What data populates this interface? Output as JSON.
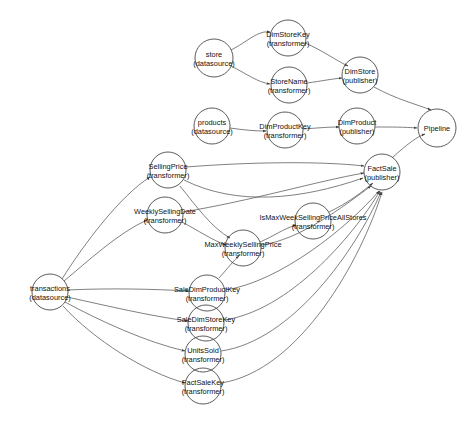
{
  "diagram": {
    "background_color": "#ffffff",
    "node_stroke_color": "#4a4a4a",
    "edge_color": "#555555",
    "text_color": "#111111",
    "node_radius": 18,
    "nodes": [
      {
        "id": "store",
        "name": "store",
        "kind": "(datasource)",
        "cx": 214,
        "cy": 58,
        "r": 19
      },
      {
        "id": "DimStoreKey",
        "name": "DimStoreKey",
        "kind": "(transformer)",
        "cx": 288,
        "cy": 38,
        "r": 18
      },
      {
        "id": "StoreName",
        "name": "StoreName",
        "kind": "(transformer)",
        "cx": 289,
        "cy": 85,
        "r": 18
      },
      {
        "id": "DimStore",
        "name": "DimStore",
        "kind": "(publisher)",
        "cx": 360,
        "cy": 75,
        "r": 18
      },
      {
        "id": "products",
        "name": "products",
        "kind": "(datasource)",
        "cx": 212,
        "cy": 126,
        "r": 18
      },
      {
        "id": "DimProductKey",
        "name": "DimProductKey",
        "kind": "(transformer)",
        "cx": 285,
        "cy": 130,
        "r": 18
      },
      {
        "id": "DimProduct",
        "name": "DimProduct",
        "kind": "(publisher)",
        "cx": 357,
        "cy": 126,
        "r": 18
      },
      {
        "id": "Pipeline",
        "name": "Pipeline",
        "kind": "",
        "cx": 437,
        "cy": 128,
        "r": 19
      },
      {
        "id": "SellingPrice",
        "name": "SellingPrice",
        "kind": "(transformer)",
        "cx": 168,
        "cy": 170,
        "r": 18
      },
      {
        "id": "WeeklySellingDate",
        "name": "WeeklySellingDate",
        "kind": "(transformer)",
        "cx": 165,
        "cy": 215,
        "r": 18
      },
      {
        "id": "IsMaxWeekSellingPriceAllStores",
        "name": "IsMaxWeekSellingPriceAllStores",
        "kind": "(transformer)",
        "cx": 313,
        "cy": 221,
        "r": 18
      },
      {
        "id": "MaxWeeklySellingPrice",
        "name": "MaxWeeklySellingPrice",
        "kind": "(transformer)",
        "cx": 243,
        "cy": 248,
        "r": 18
      },
      {
        "id": "FactSale",
        "name": "FactSale",
        "kind": "(publisher)",
        "cx": 382,
        "cy": 172,
        "r": 18
      },
      {
        "id": "transactions",
        "name": "transactions",
        "kind": "(datasource)",
        "cx": 50,
        "cy": 292,
        "r": 18
      },
      {
        "id": "SaleDimProductKey",
        "name": "SaleDimProductKey",
        "kind": "(transformer)",
        "cx": 207,
        "cy": 293,
        "r": 18
      },
      {
        "id": "SaleDimStoreKey",
        "name": "SaleDimStoreKey",
        "kind": "(transformer)",
        "cx": 206,
        "cy": 323,
        "r": 18
      },
      {
        "id": "UnitsSold",
        "name": "UnitsSold",
        "kind": "(transformer)",
        "cx": 203,
        "cy": 354,
        "r": 18
      },
      {
        "id": "FactSaleKey",
        "name": "FactSaleKey",
        "kind": "(transformer)",
        "cx": 203,
        "cy": 386,
        "r": 18
      }
    ],
    "edges": [
      {
        "from": "store",
        "to": "DimStoreKey",
        "d": "M 231,50 C 247,42 258,30 270,32"
      },
      {
        "from": "store",
        "to": "StoreName",
        "d": "M 231,66 C 247,74 257,82 270,84"
      },
      {
        "from": "DimStoreKey",
        "to": "DimStore",
        "d": "M 305,43 C 322,50 335,60 348,66"
      },
      {
        "from": "StoreName",
        "to": "DimStore",
        "d": "M 307,83 C 322,81 331,79 342,78"
      },
      {
        "from": "products",
        "to": "DimProductKey",
        "d": "M 230,128 C 244,130 254,131 266,131"
      },
      {
        "from": "DimProductKey",
        "to": "DimProduct",
        "d": "M 303,129 C 318,128 327,127 339,127"
      },
      {
        "from": "DimProduct",
        "to": "Pipeline",
        "d": "M 375,127 C 392,127 404,127 417,128"
      },
      {
        "from": "DimStore",
        "to": "Pipeline",
        "d": "M 374,87 C 398,100 416,104 431,110"
      },
      {
        "from": "FactSale",
        "to": "Pipeline",
        "d": "M 392,158 C 406,145 418,136 425,134"
      },
      {
        "from": "SellingPrice",
        "to": "FactSale",
        "d": "M 186,167 C 250,162 320,161 364,166"
      },
      {
        "from": "SellingPrice",
        "to": "FactSale",
        "d": "M 184,180 C 236,206 300,200 363,178"
      },
      {
        "from": "SellingPrice",
        "to": "MaxWeeklySellingPrice",
        "d": "M 180,186 C 196,206 212,228 230,238"
      },
      {
        "from": "WeeklySellingDate",
        "to": "FactSale",
        "d": "M 183,212 C 250,201 318,181 364,173"
      },
      {
        "from": "WeeklySellingDate",
        "to": "MaxWeeklySellingPrice",
        "d": "M 182,222 C 199,231 212,240 226,245"
      },
      {
        "from": "MaxWeeklySellingPrice",
        "to": "IsMaxWeekSellingPriceAllStores",
        "d": "M 260,242 C 274,236 283,229 296,225"
      },
      {
        "from": "MaxWeeklySellingPrice",
        "to": "FactSale",
        "d": "M 261,245 C 300,240 344,206 371,186"
      },
      {
        "from": "IsMaxWeekSellingPriceAllStores",
        "to": "FactSale",
        "d": "M 329,212 C 348,203 362,192 373,183"
      },
      {
        "from": "transactions",
        "to": "SellingPrice",
        "d": "M 62,279 C 84,244 120,196 150,177"
      },
      {
        "from": "transactions",
        "to": "WeeklySellingDate",
        "d": "M 64,281 C 87,262 118,233 147,220"
      },
      {
        "from": "transactions",
        "to": "SaleDimProductKey",
        "d": "M 68,290 C 110,288 152,289 189,291"
      },
      {
        "from": "transactions",
        "to": "SaleDimStoreKey",
        "d": "M 67,297 C 108,306 150,316 188,321"
      },
      {
        "from": "transactions",
        "to": "UnitsSold",
        "d": "M 65,302 C 100,321 146,342 185,351"
      },
      {
        "from": "transactions",
        "to": "FactSaleKey",
        "d": "M 63,306 C 94,340 145,372 185,383"
      },
      {
        "from": "SaleDimProductKey",
        "to": "MaxWeeklySellingPrice",
        "d": "M 219,278 C 228,268 234,260 239,256"
      },
      {
        "from": "SaleDimProductKey",
        "to": "FactSale",
        "d": "M 225,290 C 280,282 348,227 379,191"
      },
      {
        "from": "SaleDimStoreKey",
        "to": "FactSale",
        "d": "M 224,320 C 288,311 352,238 380,191"
      },
      {
        "from": "UnitsSold",
        "to": "FactSale",
        "d": "M 221,351 C 292,341 356,250 381,192"
      },
      {
        "from": "FactSaleKey",
        "to": "FactSale",
        "d": "M 221,383 C 300,371 362,258 382,192"
      }
    ]
  }
}
